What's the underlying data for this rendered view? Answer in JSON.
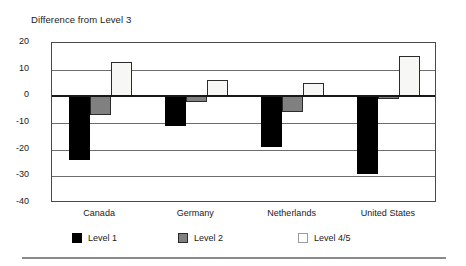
{
  "chart_data": {
    "type": "bar",
    "title": "Difference from Level 3",
    "xlabel": "",
    "ylabel": "",
    "ylim": [
      -40,
      20
    ],
    "yticks": [
      20,
      10,
      0,
      -10,
      -20,
      -30,
      -40
    ],
    "ytick_labels": [
      "20",
      "10",
      "0",
      "-10",
      "-20",
      "-30",
      "-40"
    ],
    "grid": true,
    "zero_line": true,
    "legend_position": "bottom",
    "categories": [
      "Canada",
      "Germany",
      "Netherlands",
      "United States"
    ],
    "series": [
      {
        "name": "Level 1",
        "color": "#000000",
        "values": [
          -24,
          -11,
          -19,
          -29
        ]
      },
      {
        "name": "Level 2",
        "color": "#808080",
        "values": [
          -7,
          -2,
          -6,
          -1
        ]
      },
      {
        "name": "Level 4/5",
        "color": "#f7f7f5",
        "values": [
          13,
          6,
          5,
          15
        ]
      }
    ]
  },
  "legend": {
    "items": [
      {
        "label": "Level 1"
      },
      {
        "label": "Level 2"
      },
      {
        "label": "Level 4/5"
      }
    ]
  }
}
